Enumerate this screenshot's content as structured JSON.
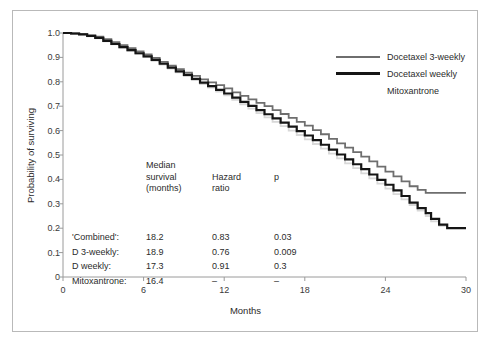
{
  "axes": {
    "xlabel": "Months",
    "ylabel": "Probability of surviving",
    "xticks": [
      "0",
      "6",
      "12",
      "18",
      "24",
      "30"
    ],
    "yticks": [
      "1.0",
      "0.9",
      "0.8",
      "0.7",
      "0.6",
      "0.5",
      "0.4",
      "0.3",
      "0.2",
      "0.1",
      "0"
    ]
  },
  "legend": {
    "items": [
      {
        "label": "Docetaxel 3-weekly",
        "swatch": "mid",
        "color": "#6e6e6e"
      },
      {
        "label": "Docetaxel weekly",
        "swatch": "thick",
        "color": "#151515"
      },
      {
        "label": "Mitoxantrone",
        "swatch": "none",
        "color": "#d8d8d8"
      }
    ]
  },
  "stats": {
    "headers": {
      "label": "",
      "median_l1": "Median",
      "median_l2": "survival",
      "median_l3": "(months)",
      "hazard_l1": "Hazard",
      "hazard_l2": "ratio",
      "p": "p"
    },
    "rows": [
      {
        "label": "'Combined':",
        "median": "18.2",
        "hazard": "0.83",
        "p": "0.03"
      },
      {
        "label": "D 3-weekly:",
        "median": "18.9",
        "hazard": "0.76",
        "p": "0.009"
      },
      {
        "label": "D weekly:",
        "median": "17.3",
        "hazard": "0.91",
        "p": "0.3"
      },
      {
        "label": "Mitoxantrone:",
        "median": "16.4",
        "hazard": "–",
        "p": "–"
      }
    ]
  },
  "chart_data": {
    "type": "line",
    "title": "",
    "xlabel": "Months",
    "ylabel": "Probability of surviving",
    "xlim": [
      0,
      30
    ],
    "ylim": [
      0,
      1.0
    ],
    "grid": false,
    "legend_position": "top-right",
    "note": "Kaplan-Meier survival curves; step-wise survival probability by treatment arm",
    "series": [
      {
        "name": "Docetaxel 3-weekly",
        "color": "#6e6e6e",
        "points": [
          [
            0,
            1.0
          ],
          [
            0.6,
            0.998
          ],
          [
            1.2,
            0.995
          ],
          [
            1.8,
            0.99
          ],
          [
            2.4,
            0.985
          ],
          [
            3,
            0.975
          ],
          [
            3.6,
            0.963
          ],
          [
            4.2,
            0.95
          ],
          [
            4.8,
            0.938
          ],
          [
            5.4,
            0.925
          ],
          [
            6,
            0.912
          ],
          [
            6.6,
            0.898
          ],
          [
            7.2,
            0.882
          ],
          [
            7.8,
            0.866
          ],
          [
            8.4,
            0.852
          ],
          [
            9,
            0.838
          ],
          [
            9.6,
            0.824
          ],
          [
            10.2,
            0.81
          ],
          [
            10.8,
            0.798
          ],
          [
            11.4,
            0.786
          ],
          [
            12,
            0.773
          ],
          [
            12.6,
            0.757
          ],
          [
            13.2,
            0.742
          ],
          [
            13.8,
            0.728
          ],
          [
            14.4,
            0.714
          ],
          [
            15,
            0.7
          ],
          [
            15.6,
            0.684
          ],
          [
            16.2,
            0.668
          ],
          [
            16.8,
            0.652
          ],
          [
            17.4,
            0.636
          ],
          [
            18,
            0.62
          ],
          [
            18.6,
            0.602
          ],
          [
            19.2,
            0.585
          ],
          [
            19.8,
            0.566
          ],
          [
            20.4,
            0.548
          ],
          [
            21,
            0.53
          ],
          [
            21.6,
            0.512
          ],
          [
            22.2,
            0.493
          ],
          [
            22.8,
            0.474
          ],
          [
            23.4,
            0.452
          ],
          [
            24,
            0.432
          ],
          [
            24.6,
            0.412
          ],
          [
            25.2,
            0.392
          ],
          [
            25.8,
            0.372
          ],
          [
            26.4,
            0.357
          ],
          [
            27,
            0.345
          ],
          [
            27.6,
            0.345
          ],
          [
            28.2,
            0.345
          ],
          [
            29,
            0.345
          ],
          [
            30,
            0.345
          ]
        ]
      },
      {
        "name": "Docetaxel weekly",
        "color": "#151515",
        "points": [
          [
            0,
            1.0
          ],
          [
            0.6,
            0.998
          ],
          [
            1.2,
            0.994
          ],
          [
            1.8,
            0.988
          ],
          [
            2.4,
            0.98
          ],
          [
            3,
            0.968
          ],
          [
            3.6,
            0.955
          ],
          [
            4.2,
            0.942
          ],
          [
            4.8,
            0.93
          ],
          [
            5.4,
            0.917
          ],
          [
            6,
            0.904
          ],
          [
            6.6,
            0.89
          ],
          [
            7.2,
            0.874
          ],
          [
            7.8,
            0.858
          ],
          [
            8.4,
            0.843
          ],
          [
            9,
            0.828
          ],
          [
            9.6,
            0.812
          ],
          [
            10.2,
            0.797
          ],
          [
            10.8,
            0.782
          ],
          [
            11.4,
            0.767
          ],
          [
            12,
            0.752
          ],
          [
            12.6,
            0.735
          ],
          [
            13.2,
            0.718
          ],
          [
            13.8,
            0.701
          ],
          [
            14.4,
            0.684
          ],
          [
            15,
            0.667
          ],
          [
            15.6,
            0.65
          ],
          [
            16.2,
            0.633
          ],
          [
            16.8,
            0.616
          ],
          [
            17.4,
            0.598
          ],
          [
            18,
            0.58
          ],
          [
            18.6,
            0.561
          ],
          [
            19.2,
            0.542
          ],
          [
            19.8,
            0.522
          ],
          [
            20.4,
            0.502
          ],
          [
            21,
            0.482
          ],
          [
            21.6,
            0.462
          ],
          [
            22.2,
            0.442
          ],
          [
            22.8,
            0.42
          ],
          [
            23.4,
            0.398
          ],
          [
            24,
            0.378
          ],
          [
            24.6,
            0.355
          ],
          [
            25.2,
            0.332
          ],
          [
            25.8,
            0.305
          ],
          [
            26.4,
            0.282
          ],
          [
            27,
            0.262
          ],
          [
            27.4,
            0.238
          ],
          [
            28,
            0.215
          ],
          [
            28.6,
            0.2
          ],
          [
            29.3,
            0.2
          ],
          [
            30,
            0.2
          ]
        ]
      },
      {
        "name": "Mitoxantrone",
        "color": "#d8d8d8",
        "points": [
          [
            0,
            1.0
          ],
          [
            0.6,
            0.997
          ],
          [
            1.2,
            0.993
          ],
          [
            1.8,
            0.986
          ],
          [
            2.4,
            0.978
          ],
          [
            3,
            0.966
          ],
          [
            3.6,
            0.953
          ],
          [
            4.2,
            0.94
          ],
          [
            4.8,
            0.927
          ],
          [
            5.4,
            0.914
          ],
          [
            6,
            0.901
          ],
          [
            6.6,
            0.886
          ],
          [
            7.2,
            0.87
          ],
          [
            7.8,
            0.854
          ],
          [
            8.4,
            0.839
          ],
          [
            9,
            0.823
          ],
          [
            9.6,
            0.807
          ],
          [
            10.2,
            0.791
          ],
          [
            10.8,
            0.776
          ],
          [
            11.4,
            0.76
          ],
          [
            12,
            0.744
          ],
          [
            12.6,
            0.726
          ],
          [
            13.2,
            0.708
          ],
          [
            13.8,
            0.69
          ],
          [
            14.4,
            0.672
          ],
          [
            15,
            0.654
          ],
          [
            15.6,
            0.636
          ],
          [
            16.2,
            0.618
          ],
          [
            16.8,
            0.6
          ],
          [
            17.4,
            0.582
          ],
          [
            18,
            0.564
          ],
          [
            18.6,
            0.545
          ],
          [
            19.2,
            0.526
          ],
          [
            19.8,
            0.506
          ],
          [
            20.4,
            0.486
          ],
          [
            21,
            0.466
          ],
          [
            21.6,
            0.446
          ],
          [
            22.2,
            0.425
          ],
          [
            22.8,
            0.404
          ],
          [
            23.4,
            0.383
          ],
          [
            24,
            0.362
          ],
          [
            24.6,
            0.34
          ],
          [
            25.2,
            0.318
          ],
          [
            25.8,
            0.295
          ],
          [
            26.4,
            0.272
          ],
          [
            27,
            0.25
          ],
          [
            27.4,
            0.228
          ],
          [
            28,
            0.21
          ],
          [
            28.6,
            0.2
          ],
          [
            29.3,
            0.2
          ],
          [
            30,
            0.2
          ]
        ]
      }
    ]
  }
}
